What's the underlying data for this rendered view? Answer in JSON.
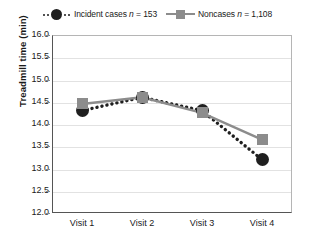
{
  "chart_data": {
    "type": "line",
    "title": "",
    "xlabel": "",
    "ylabel": "Treadmill time (min)",
    "categories": [
      "Visit 1",
      "Visit 2",
      "Visit 3",
      "Visit 4"
    ],
    "ylim": [
      12.0,
      16.0
    ],
    "ytick_step": 0.5,
    "yticks": [
      "16.0",
      "15.5",
      "15.0",
      "14.5",
      "14.0",
      "13.5",
      "13.0",
      "12.5",
      "12.0"
    ],
    "ytick_values": [
      16.0,
      15.5,
      15.0,
      14.5,
      14.0,
      13.5,
      13.0,
      12.5,
      12.0
    ],
    "grid": true,
    "legend_position": "top-center",
    "series": [
      {
        "name": "Incident cases n = 153",
        "label_text": "Incident cases",
        "label_stat": "n",
        "label_value": "= 153",
        "marker": "circle",
        "linestyle": "dotted",
        "color": "#1f1f1f",
        "values": [
          14.3,
          14.6,
          14.3,
          13.2
        ]
      },
      {
        "name": "Noncases n = 1,108",
        "label_text": "Noncases",
        "label_stat": "n",
        "label_value": "= 1,108",
        "marker": "square",
        "linestyle": "solid",
        "color": "#8c8c8c",
        "values": [
          14.45,
          14.6,
          14.25,
          13.65
        ]
      }
    ]
  }
}
